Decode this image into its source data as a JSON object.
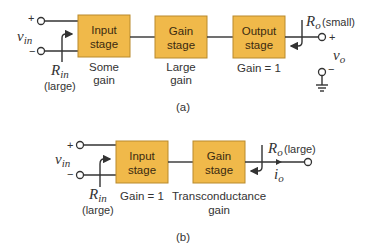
{
  "diagram_a": {
    "caption": "(a)",
    "input": {
      "plus": "+",
      "minus": "−",
      "v_label": "v",
      "v_sub": "in",
      "r_label": "R",
      "r_sub": "in",
      "r_note": "(large)"
    },
    "stages": [
      {
        "line1": "Input",
        "line2": "stage",
        "note1": "Some",
        "note2": "gain"
      },
      {
        "line1": "Gain",
        "line2": "stage",
        "note1": "Large",
        "note2": "gain"
      },
      {
        "line1": "Output",
        "line2": "stage",
        "note1": "Gain = 1",
        "note2": ""
      }
    ],
    "output": {
      "r_label": "R",
      "r_sub": "o",
      "r_note": "(small)",
      "plus": "+",
      "minus": "−",
      "v_label": "v",
      "v_sub": "o"
    }
  },
  "diagram_b": {
    "caption": "(b)",
    "input": {
      "plus": "+",
      "minus": "−",
      "v_label": "v",
      "v_sub": "in",
      "r_label": "R",
      "r_sub": "in",
      "r_note": "(large)"
    },
    "stages": [
      {
        "line1": "Input",
        "line2": "stage",
        "note1": "Gain = 1",
        "note2": ""
      },
      {
        "line1": "Gain",
        "line2": "stage",
        "note1": "Transconductance",
        "note2": "gain"
      }
    ],
    "output": {
      "r_label": "R",
      "r_sub": "o",
      "r_note": "(large)",
      "i_label": "i",
      "i_sub": "o"
    }
  },
  "colors": {
    "stage_fill": "#f0b94a",
    "stage_stroke": "#b98a2c"
  }
}
